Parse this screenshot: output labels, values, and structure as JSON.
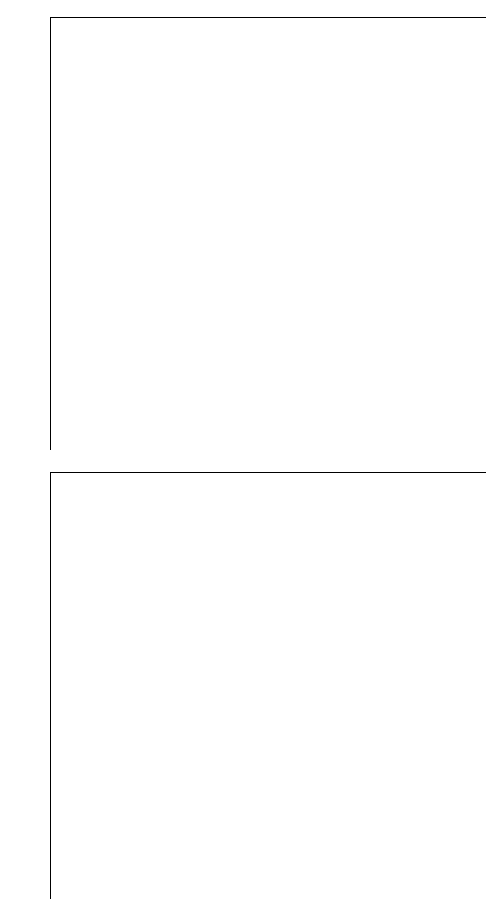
{
  "page": {
    "width": 497,
    "height": 899,
    "background": "#ffffff",
    "bar_color": "#2b2b2b",
    "axis_color": "#000000"
  },
  "chart_data": [
    {
      "id": "chart-top",
      "type": "bar",
      "orientation": "horizontal",
      "title": "",
      "xlabel": "",
      "ylabel": "",
      "xlim": [
        0,
        120
      ],
      "xticks": [
        0,
        20,
        40,
        60,
        80,
        100,
        120
      ],
      "xticklabels": [
        "0",
        "20",
        "40",
        "60",
        "80",
        "100",
        "120"
      ],
      "grid": false,
      "legend": false,
      "categories": [
        "101.3",
        "94.4",
        "91.1",
        "89.8",
        "86.9",
        "82.8",
        "80.5",
        "73.4",
        "73.1",
        "72.9",
        "72.7",
        "72.0",
        "64.3",
        "62.8",
        "61.3",
        "60.2",
        "58.9",
        "58.5",
        "57.6",
        "56.5",
        "54.7",
        "53.4",
        "53.2",
        "41.8",
        "36.9",
        "36.5",
        "36.3",
        "34.9",
        "34.7",
        "31.4",
        "30.9",
        "29.6",
        "27.9",
        "25.4",
        "25.3",
        "21.2",
        "18.1",
        "17.8",
        "15.7",
        "13.8"
      ],
      "values": [
        101.3,
        94.4,
        91.1,
        89.8,
        86.9,
        82.8,
        80.5,
        73.4,
        73.1,
        72.9,
        72.7,
        72.0,
        64.3,
        62.8,
        61.3,
        60.2,
        58.9,
        58.5,
        57.6,
        56.5,
        54.7,
        53.4,
        53.2,
        41.8,
        36.9,
        36.5,
        36.3,
        34.9,
        34.7,
        31.4,
        30.9,
        29.6,
        27.9,
        25.4,
        25.3,
        21.2,
        18.1,
        17.8,
        15.7,
        13.8
      ],
      "summary_rows": [
        {
          "label": "110.0",
          "value": 110.0,
          "style": "total"
        },
        {
          "label": "5.8",
          "value": 5.8,
          "style": "normal"
        }
      ],
      "annotations": []
    },
    {
      "id": "chart-bottom",
      "type": "bar",
      "orientation": "horizontal",
      "title": "",
      "xlabel": "",
      "ylabel": "",
      "xlim": [
        0,
        120
      ],
      "xticks": [
        0,
        20,
        40,
        60,
        80,
        100,
        120
      ],
      "xticklabels": [
        "0",
        "20",
        "40",
        "60",
        "80",
        "100",
        "120"
      ],
      "grid": false,
      "legend": false,
      "categories": [
        "68.1",
        "39.7",
        "29.6",
        "26.4",
        "25.7",
        "25.3",
        "24.2",
        "22.8",
        "21.9",
        "19.0",
        "18.5",
        "16.9",
        "16.7",
        "15.2",
        "12.3",
        "11.8",
        "11.3",
        "10.8",
        "9.7",
        "9.6",
        "9.0",
        "8.7",
        "8.7",
        "7.9",
        "7.6",
        "7.3",
        "7.1",
        "7.1",
        "6.8",
        "6.7",
        "6.6",
        "6.5",
        "6.4",
        "6.2",
        "5.8",
        "5.8",
        "5.8",
        "4.0",
        "3.9",
        "3.5"
      ],
      "values": [
        68.1,
        39.7,
        29.6,
        26.4,
        25.7,
        25.3,
        24.2,
        22.8,
        21.9,
        19.0,
        18.5,
        16.9,
        16.7,
        15.2,
        12.3,
        11.8,
        11.3,
        10.8,
        9.7,
        9.6,
        9.0,
        8.7,
        8.7,
        7.9,
        7.6,
        7.3,
        7.1,
        7.1,
        6.8,
        6.7,
        6.6,
        6.5,
        6.4,
        6.2,
        5.8,
        5.8,
        5.8,
        4.0,
        3.9,
        3.5
      ],
      "summary_rows": [
        {
          "label": "68.1",
          "value": 68.1,
          "style": "total"
        },
        {
          "label": "1.2",
          "value": 1.2,
          "style": "normal"
        }
      ],
      "annotations": [
        {
          "marker": "*",
          "category": "6.6",
          "index": 30
        }
      ]
    }
  ]
}
